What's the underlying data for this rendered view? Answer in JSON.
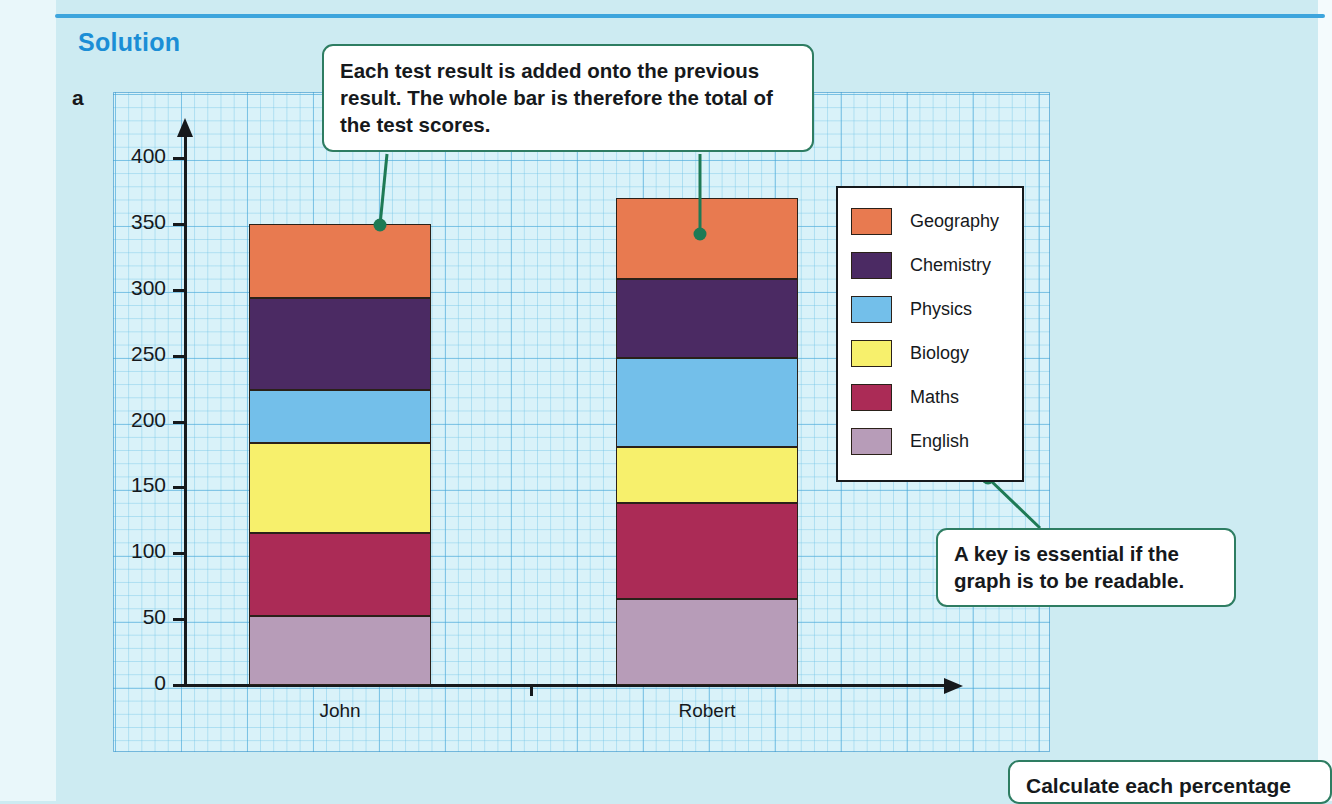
{
  "page": {
    "section_title": "Solution",
    "part_label": "a",
    "background_color": "#cdebf2",
    "rule_color": "#3da5dd"
  },
  "callouts": [
    {
      "name": "stacked-explanation",
      "text": "Each test result is added onto the previous result. The whole bar is therefore the total of the test scores."
    },
    {
      "name": "key-explanation",
      "text": "A key is essential if the graph is to be readable."
    },
    {
      "name": "percentage-note",
      "text": "Calculate each percentage"
    }
  ],
  "legend": {
    "items": [
      {
        "label": "Geography",
        "color": "#e87a50"
      },
      {
        "label": "Chemistry",
        "color": "#4b2a63"
      },
      {
        "label": "Physics",
        "color": "#73bfea"
      },
      {
        "label": "Biology",
        "color": "#f7f06c"
      },
      {
        "label": "Maths",
        "color": "#ab2b56"
      },
      {
        "label": "English",
        "color": "#b79cb8"
      }
    ]
  },
  "chart_data": {
    "type": "bar",
    "stacked": true,
    "title": "",
    "xlabel": "",
    "ylabel": "",
    "categories": [
      "John",
      "Robert"
    ],
    "ylim": [
      0,
      400
    ],
    "yticks": [
      0,
      50,
      100,
      150,
      200,
      250,
      300,
      350,
      400
    ],
    "ytick_labels": [
      "0",
      "50",
      "100",
      "150",
      "200",
      "250",
      "300",
      "350",
      "400"
    ],
    "grid": true,
    "legend_position": "right",
    "series": [
      {
        "name": "English",
        "color": "#b79cb8",
        "values": [
          52,
          65
        ]
      },
      {
        "name": "Maths",
        "color": "#ab2b56",
        "values": [
          63,
          73
        ]
      },
      {
        "name": "Biology",
        "color": "#f7f06c",
        "values": [
          69,
          43
        ]
      },
      {
        "name": "Physics",
        "color": "#73bfea",
        "values": [
          40,
          67
        ]
      },
      {
        "name": "Chemistry",
        "color": "#4b2a63",
        "values": [
          70,
          60
        ]
      },
      {
        "name": "Geography",
        "color": "#e87a50",
        "values": [
          56,
          62
        ]
      }
    ],
    "totals": [
      350,
      370
    ]
  }
}
